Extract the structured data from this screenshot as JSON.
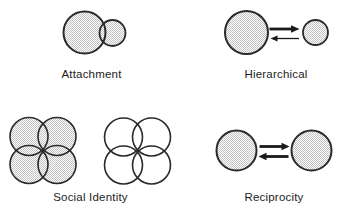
{
  "figure": {
    "colors": {
      "background": "#ffffff",
      "circle_outline": "#2a2a2a",
      "stipple_fill": "#c2c2c2",
      "arrow": "#1a1a1a",
      "label_text": "#1c1c1c"
    },
    "panels": [
      {
        "id": "attachment",
        "label": "Attachment",
        "elements": [
          "large-stippled-circle",
          "small-stippled-circle-overlapping"
        ]
      },
      {
        "id": "hierarchical",
        "label": "Hierarchical",
        "elements": [
          "large-stippled-circle",
          "small-stippled-circle",
          "thick-arrow-right",
          "thin-arrow-left"
        ]
      },
      {
        "id": "social_identity",
        "label": "Social Identity",
        "elements": [
          "four-overlapping-stippled-circles",
          "four-overlapping-outline-circles"
        ]
      },
      {
        "id": "reciprocity",
        "label": "Reciprocity",
        "elements": [
          "stippled-circle",
          "stippled-circle",
          "thick-arrow-right",
          "thick-arrow-left"
        ]
      }
    ]
  }
}
